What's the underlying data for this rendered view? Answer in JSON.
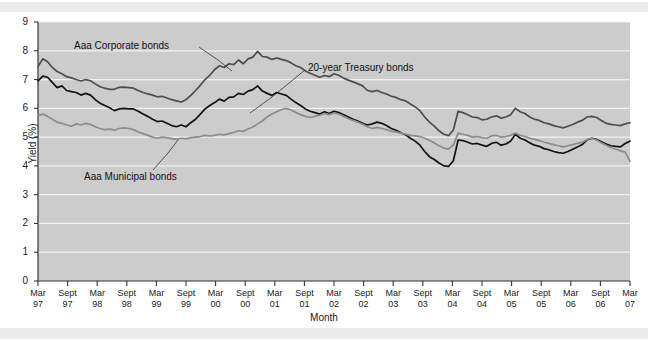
{
  "chart_data": {
    "type": "line",
    "title": "",
    "xlabel": "Month",
    "ylabel": "Yield (%)",
    "ylim": [
      0,
      9
    ],
    "yticks": [
      0,
      1,
      2,
      3,
      4,
      5,
      6,
      7,
      8,
      9
    ],
    "grid": true,
    "legend_position": "inline-annotations",
    "x_tick_labels": [
      {
        "month": "Mar",
        "year": "97"
      },
      {
        "month": "Sept",
        "year": "97"
      },
      {
        "month": "Mar",
        "year": "98"
      },
      {
        "month": "Sept",
        "year": "98"
      },
      {
        "month": "Mar",
        "year": "99"
      },
      {
        "month": "Sept",
        "year": "99"
      },
      {
        "month": "Mar",
        "year": "00"
      },
      {
        "month": "Sept",
        "year": "00"
      },
      {
        "month": "Mar",
        "year": "01"
      },
      {
        "month": "Sept",
        "year": "01"
      },
      {
        "month": "Mar",
        "year": "02"
      },
      {
        "month": "Sept",
        "year": "02"
      },
      {
        "month": "Mar",
        "year": "03"
      },
      {
        "month": "Sept",
        "year": "03"
      },
      {
        "month": "Mar",
        "year": "04"
      },
      {
        "month": "Sept",
        "year": "04"
      },
      {
        "month": "Mar",
        "year": "05"
      },
      {
        "month": "Sept",
        "year": "05"
      },
      {
        "month": "Mar",
        "year": "06"
      },
      {
        "month": "Sept",
        "year": "06"
      },
      {
        "month": "Mar",
        "year": "07"
      }
    ],
    "annotations": [
      {
        "id": "aaa-corporate",
        "text": "Aaa Corporate bonds"
      },
      {
        "id": "treasury-20yr",
        "text": "20-year Treasury bonds"
      },
      {
        "id": "aaa-municipal",
        "text": "Aaa Municipal bonds"
      }
    ],
    "series": [
      {
        "name": "Aaa Corporate bonds",
        "color": "#4d4d4d",
        "values": [
          7.45,
          7.72,
          7.62,
          7.42,
          7.28,
          7.2,
          7.1,
          7.06,
          7.0,
          6.95,
          7.0,
          6.96,
          6.85,
          6.75,
          6.7,
          6.66,
          6.66,
          6.73,
          6.74,
          6.72,
          6.7,
          6.62,
          6.55,
          6.5,
          6.46,
          6.4,
          6.42,
          6.36,
          6.3,
          6.26,
          6.22,
          6.3,
          6.45,
          6.62,
          6.8,
          7.0,
          7.15,
          7.35,
          7.48,
          7.42,
          7.55,
          7.52,
          7.68,
          7.55,
          7.72,
          7.78,
          7.98,
          7.8,
          7.78,
          7.7,
          7.75,
          7.7,
          7.66,
          7.58,
          7.48,
          7.42,
          7.3,
          7.22,
          7.15,
          7.08,
          7.14,
          7.1,
          7.2,
          7.15,
          7.05,
          6.98,
          6.92,
          6.85,
          6.78,
          6.62,
          6.58,
          6.62,
          6.55,
          6.5,
          6.42,
          6.38,
          6.3,
          6.26,
          6.15,
          6.05,
          5.92,
          5.7,
          5.52,
          5.38,
          5.22,
          5.1,
          5.05,
          5.25,
          5.9,
          5.85,
          5.78,
          5.7,
          5.68,
          5.6,
          5.62,
          5.7,
          5.74,
          5.66,
          5.7,
          5.78,
          6.0,
          5.88,
          5.82,
          5.7,
          5.62,
          5.58,
          5.5,
          5.46,
          5.4,
          5.36,
          5.32,
          5.38,
          5.44,
          5.52,
          5.58,
          5.7,
          5.72,
          5.68,
          5.58,
          5.48,
          5.44,
          5.42,
          5.4,
          5.46,
          5.5
        ]
      },
      {
        "name": "20-year Treasury bonds",
        "color": "#121212",
        "values": [
          6.95,
          7.12,
          7.08,
          6.9,
          6.72,
          6.78,
          6.62,
          6.58,
          6.55,
          6.46,
          6.52,
          6.46,
          6.3,
          6.18,
          6.1,
          6.02,
          5.92,
          5.98,
          6.0,
          5.98,
          5.98,
          5.9,
          5.8,
          5.72,
          5.62,
          5.54,
          5.56,
          5.48,
          5.4,
          5.36,
          5.42,
          5.36,
          5.5,
          5.62,
          5.8,
          5.98,
          6.1,
          6.2,
          6.32,
          6.25,
          6.38,
          6.4,
          6.52,
          6.48,
          6.6,
          6.65,
          6.78,
          6.6,
          6.52,
          6.45,
          6.55,
          6.5,
          6.45,
          6.32,
          6.2,
          6.1,
          5.98,
          5.9,
          5.85,
          5.8,
          5.88,
          5.82,
          5.9,
          5.85,
          5.78,
          5.7,
          5.62,
          5.56,
          5.48,
          5.42,
          5.46,
          5.52,
          5.48,
          5.4,
          5.3,
          5.24,
          5.15,
          5.08,
          4.96,
          4.86,
          4.72,
          4.5,
          4.32,
          4.22,
          4.1,
          4.0,
          3.98,
          4.18,
          4.9,
          4.88,
          4.82,
          4.76,
          4.78,
          4.72,
          4.68,
          4.78,
          4.82,
          4.72,
          4.76,
          4.86,
          5.1,
          4.96,
          4.9,
          4.8,
          4.72,
          4.68,
          4.6,
          4.56,
          4.5,
          4.46,
          4.44,
          4.5,
          4.58,
          4.66,
          4.74,
          4.9,
          4.96,
          4.92,
          4.84,
          4.76,
          4.7,
          4.68,
          4.66,
          4.78,
          4.86
        ]
      },
      {
        "name": "Aaa Municipal bonds",
        "color": "#8c8c8c",
        "values": [
          5.75,
          5.8,
          5.72,
          5.62,
          5.52,
          5.48,
          5.42,
          5.38,
          5.46,
          5.42,
          5.48,
          5.44,
          5.36,
          5.3,
          5.26,
          5.28,
          5.24,
          5.3,
          5.32,
          5.3,
          5.26,
          5.18,
          5.12,
          5.06,
          5.0,
          4.96,
          5.0,
          4.98,
          4.95,
          4.92,
          4.96,
          4.94,
          4.98,
          5.0,
          5.02,
          5.06,
          5.04,
          5.06,
          5.1,
          5.08,
          5.12,
          5.16,
          5.22,
          5.2,
          5.28,
          5.35,
          5.46,
          5.56,
          5.7,
          5.8,
          5.88,
          5.96,
          6.0,
          5.94,
          5.86,
          5.78,
          5.72,
          5.68,
          5.72,
          5.76,
          5.82,
          5.78,
          5.84,
          5.8,
          5.72,
          5.65,
          5.58,
          5.52,
          5.45,
          5.36,
          5.3,
          5.34,
          5.3,
          5.26,
          5.2,
          5.18,
          5.14,
          5.1,
          5.06,
          5.04,
          5.02,
          4.96,
          4.88,
          4.8,
          4.7,
          4.62,
          4.58,
          4.72,
          5.14,
          5.1,
          5.06,
          5.0,
          5.02,
          4.98,
          4.96,
          5.04,
          5.06,
          5.0,
          5.02,
          5.06,
          5.14,
          5.06,
          5.02,
          4.96,
          4.92,
          4.88,
          4.82,
          4.78,
          4.74,
          4.7,
          4.66,
          4.7,
          4.74,
          4.78,
          4.82,
          4.92,
          4.96,
          4.9,
          4.8,
          4.72,
          4.64,
          4.58,
          4.52,
          4.48,
          4.16
        ]
      }
    ]
  }
}
